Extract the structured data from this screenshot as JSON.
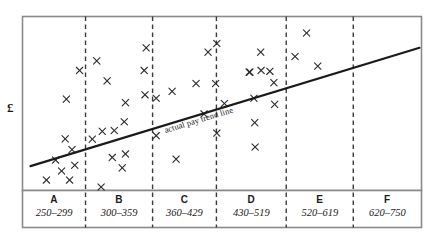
{
  "chart_data": {
    "type": "scatter",
    "title": "",
    "xlabel": "",
    "ylabel": "£",
    "grid": false,
    "legend": "none",
    "xlim": [
      0,
      1
    ],
    "ylim": [
      0,
      1
    ],
    "annotations": [
      {
        "name": "trend-line-label",
        "text": "actual pay trend line"
      }
    ],
    "trend_line": {
      "name": "actual pay trend line",
      "x_start": 0.02,
      "y_start": 0.14,
      "x_end": 0.995,
      "y_end": 0.82,
      "color": "#1a1a1a"
    },
    "categories": [
      "A",
      "B",
      "C",
      "D",
      "E",
      "F"
    ],
    "category_ranges": [
      "250–299",
      "300–359",
      "360–429",
      "430–519",
      "520–619",
      "620–750"
    ],
    "band_boundaries": [
      0.0,
      0.158,
      0.326,
      0.486,
      0.661,
      0.829,
      1.0
    ],
    "marker": "x",
    "marker_color": "#2b2b2b",
    "series": [
      {
        "name": "employee pay points",
        "points": [
          {
            "band": "A",
            "x": 0.06,
            "y": 0.06
          },
          {
            "band": "A",
            "x": 0.083,
            "y": 0.175
          },
          {
            "band": "A",
            "x": 0.098,
            "y": 0.112
          },
          {
            "band": "A",
            "x": 0.118,
            "y": 0.06
          },
          {
            "band": "A",
            "x": 0.124,
            "y": 0.235
          },
          {
            "band": "A",
            "x": 0.107,
            "y": 0.297
          },
          {
            "band": "A",
            "x": 0.131,
            "y": 0.145
          },
          {
            "band": "A",
            "x": 0.11,
            "y": 0.525
          },
          {
            "band": "A",
            "x": 0.143,
            "y": 0.69
          },
          {
            "band": "B",
            "x": 0.175,
            "y": 0.295
          },
          {
            "band": "B",
            "x": 0.186,
            "y": 0.745
          },
          {
            "band": "B",
            "x": 0.197,
            "y": 0.02
          },
          {
            "band": "B",
            "x": 0.2,
            "y": 0.34
          },
          {
            "band": "B",
            "x": 0.212,
            "y": 0.63
          },
          {
            "band": "B",
            "x": 0.225,
            "y": 0.19
          },
          {
            "band": "B",
            "x": 0.23,
            "y": 0.345
          },
          {
            "band": "B",
            "x": 0.25,
            "y": 0.13
          },
          {
            "band": "B",
            "x": 0.255,
            "y": 0.395
          },
          {
            "band": "B",
            "x": 0.258,
            "y": 0.21
          },
          {
            "band": "B",
            "x": 0.258,
            "y": 0.505
          },
          {
            "band": "C",
            "x": 0.31,
            "y": 0.82
          },
          {
            "band": "C",
            "x": 0.305,
            "y": 0.69
          },
          {
            "band": "C",
            "x": 0.307,
            "y": 0.55
          },
          {
            "band": "C",
            "x": 0.335,
            "y": 0.315
          },
          {
            "band": "C",
            "x": 0.335,
            "y": 0.53
          },
          {
            "band": "C",
            "x": 0.375,
            "y": 0.57
          },
          {
            "band": "C",
            "x": 0.385,
            "y": 0.18
          },
          {
            "band": "D",
            "x": 0.435,
            "y": 0.615
          },
          {
            "band": "D",
            "x": 0.455,
            "y": 0.44
          },
          {
            "band": "D",
            "x": 0.465,
            "y": 0.795
          },
          {
            "band": "D",
            "x": 0.487,
            "y": 0.845
          },
          {
            "band": "D",
            "x": 0.484,
            "y": 0.615
          },
          {
            "band": "D",
            "x": 0.487,
            "y": 0.33
          },
          {
            "band": "D",
            "x": 0.506,
            "y": 0.5
          },
          {
            "band": "E",
            "x": 0.568,
            "y": 0.68
          },
          {
            "band": "E",
            "x": 0.57,
            "y": 0.68
          },
          {
            "band": "E",
            "x": 0.58,
            "y": 0.53
          },
          {
            "band": "E",
            "x": 0.582,
            "y": 0.39
          },
          {
            "band": "E",
            "x": 0.583,
            "y": 0.25
          },
          {
            "band": "E",
            "x": 0.597,
            "y": 0.795
          },
          {
            "band": "E",
            "x": 0.598,
            "y": 0.69
          },
          {
            "band": "E",
            "x": 0.62,
            "y": 0.685
          },
          {
            "band": "E",
            "x": 0.63,
            "y": 0.62
          },
          {
            "band": "E",
            "x": 0.632,
            "y": 0.495
          },
          {
            "band": "F",
            "x": 0.683,
            "y": 0.77
          },
          {
            "band": "F",
            "x": 0.712,
            "y": 0.905
          },
          {
            "band": "F",
            "x": 0.74,
            "y": 0.715
          }
        ]
      }
    ]
  },
  "plot": {
    "frame_color": "#8a8a8a",
    "divider_color": "#3a3a3a"
  }
}
